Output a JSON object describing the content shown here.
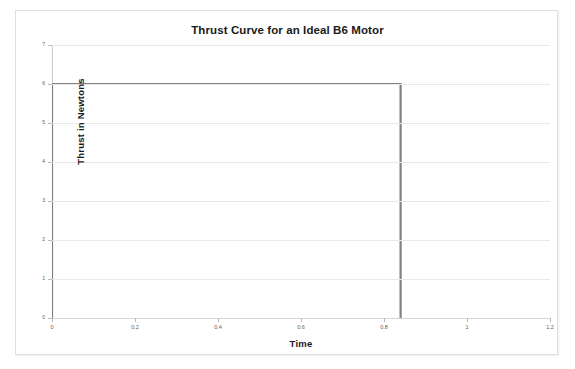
{
  "chart_data": {
    "type": "line",
    "title": "Thrust Curve for an Ideal B6 Motor",
    "xlabel": "Time",
    "ylabel": "Thrust in Newtons",
    "xlim": [
      0,
      1.2
    ],
    "ylim": [
      0,
      7
    ],
    "grid": true,
    "legend": false,
    "x_ticks": [
      "0",
      "0.2",
      "0.4",
      "0.6",
      "0.8",
      "1",
      "1.2"
    ],
    "x_tick_values": [
      0,
      0.2,
      0.4,
      0.6,
      0.8,
      1,
      1.2
    ],
    "y_ticks": [
      "0",
      "1",
      "2",
      "3",
      "4",
      "5",
      "6",
      "7"
    ],
    "y_tick_values": [
      0,
      1,
      2,
      3,
      4,
      5,
      6,
      7
    ],
    "series": [
      {
        "name": "Ideal B6 thrust",
        "color": "#808080",
        "x": [
          0,
          0,
          0.84,
          0.84
        ],
        "y": [
          0,
          6,
          6,
          0
        ]
      }
    ]
  },
  "axes": {
    "title": "Thrust Curve for an Ideal B6 Motor",
    "x_title": "Time",
    "y_title": "Thrust in Newtons"
  }
}
